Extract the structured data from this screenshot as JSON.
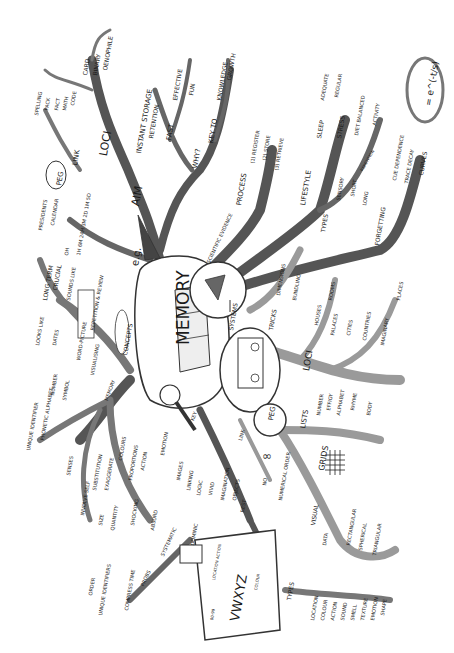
{
  "title": "MEMORY",
  "colors": {
    "branch_dark": "#555555",
    "branch_light": "#9a9a9a",
    "ink": "#1a1a1a",
    "paper": "#ffffff"
  },
  "labels": [
    {
      "id": "memory",
      "text": "MEMORY",
      "x": 175,
      "y": 345,
      "size": 17,
      "rot": -90,
      "bold": false
    },
    {
      "id": "aim",
      "text": "AIM",
      "x": 130,
      "y": 205,
      "size": 11,
      "rot": -80
    },
    {
      "id": "eg",
      "text": "e.g.",
      "x": 130,
      "y": 265,
      "size": 10,
      "rot": -80
    },
    {
      "id": "instant-storage",
      "text": "INSTANT STORAGE",
      "x": 136,
      "y": 153,
      "size": 7,
      "rot": -80
    },
    {
      "id": "retention",
      "text": "RETENTION",
      "x": 148,
      "y": 138,
      "size": 6,
      "rot": -80
    },
    {
      "id": "fast",
      "text": "FAST",
      "x": 166,
      "y": 140,
      "size": 7,
      "rot": -80
    },
    {
      "id": "effective",
      "text": "EFFECTIVE",
      "x": 172,
      "y": 100,
      "size": 6,
      "rot": -80
    },
    {
      "id": "fun",
      "text": "FUN",
      "x": 188,
      "y": 95,
      "size": 6,
      "rot": -80
    },
    {
      "id": "why",
      "text": "WHY?",
      "x": 192,
      "y": 168,
      "size": 7,
      "rot": -80
    },
    {
      "id": "key-to",
      "text": "KEY TO",
      "x": 208,
      "y": 143,
      "size": 7,
      "rot": -80
    },
    {
      "id": "knowledge",
      "text": "KNOWLEDGE",
      "x": 216,
      "y": 100,
      "size": 6,
      "rot": -80
    },
    {
      "id": "growth",
      "text": "GROWTH",
      "x": 226,
      "y": 80,
      "size": 6,
      "rot": -80
    },
    {
      "id": "loci-top",
      "text": "LOCI",
      "x": 98,
      "y": 155,
      "size": 11,
      "rot": -80
    },
    {
      "id": "link-top",
      "text": "LINK",
      "x": 72,
      "y": 165,
      "size": 7,
      "rot": -80
    },
    {
      "id": "peg-top",
      "text": "PEG",
      "x": 56,
      "y": 185,
      "size": 7,
      "rot": -80
    },
    {
      "id": "card",
      "text": "CARD",
      "x": 82,
      "y": 75,
      "size": 6,
      "rot": -80
    },
    {
      "id": "binary",
      "text": "BINARY",
      "x": 92,
      "y": 75,
      "size": 6,
      "rot": -80
    },
    {
      "id": "oenophile",
      "text": "OENOPHILE",
      "x": 102,
      "y": 70,
      "size": 6,
      "rot": -80
    },
    {
      "id": "spelling",
      "text": "SPELLING",
      "x": 34,
      "y": 115,
      "size": 5,
      "rot": -80
    },
    {
      "id": "pack",
      "text": "PACK",
      "x": 44,
      "y": 110,
      "size": 5,
      "rot": -80
    },
    {
      "id": "fact",
      "text": "FACT",
      "x": 54,
      "y": 110,
      "size": 5,
      "rot": -80
    },
    {
      "id": "math",
      "text": "MATH",
      "x": 62,
      "y": 110,
      "size": 5,
      "rot": -80
    },
    {
      "id": "code",
      "text": "CODE",
      "x": 70,
      "y": 105,
      "size": 5,
      "rot": -80
    },
    {
      "id": "presidents",
      "text": "PRESIDENTS",
      "x": 38,
      "y": 230,
      "size": 5,
      "rot": -80
    },
    {
      "id": "calendar",
      "text": "CALENDAR",
      "x": 50,
      "y": 225,
      "size": 5,
      "rot": -80
    },
    {
      "id": "oh",
      "text": "OH",
      "x": 64,
      "y": 255,
      "size": 5,
      "rot": -80
    },
    {
      "id": "times",
      "text": "1H 6M 24H 3M 2D 1M 5D",
      "x": 76,
      "y": 255,
      "size": 5,
      "rot": -80
    },
    {
      "id": "long-term",
      "text": "LONG TERM",
      "x": 42,
      "y": 300,
      "size": 6,
      "rot": -80
    },
    {
      "id": "crucial",
      "text": "CRUCIAL",
      "x": 52,
      "y": 290,
      "size": 6,
      "rot": -80
    },
    {
      "id": "sounds-like",
      "text": "SOUNDS LIKE",
      "x": 66,
      "y": 300,
      "size": 5,
      "rot": -80
    },
    {
      "id": "repetition-review",
      "text": "REPETITION & REVIEW",
      "x": 90,
      "y": 330,
      "size": 5,
      "rot": -80
    },
    {
      "id": "looks-like",
      "text": "LOOKS LIKE",
      "x": 35,
      "y": 345,
      "size": 5,
      "rot": -80
    },
    {
      "id": "dates",
      "text": "DATES",
      "x": 52,
      "y": 345,
      "size": 5,
      "rot": -80
    },
    {
      "id": "word-picture",
      "text": "WORD-PICTURE",
      "x": 76,
      "y": 360,
      "size": 5,
      "rot": -80
    },
    {
      "id": "visualising",
      "text": "VISUALISING",
      "x": 90,
      "y": 375,
      "size": 5,
      "rot": -80
    },
    {
      "id": "concepts",
      "text": "CONCEPTS",
      "x": 122,
      "y": 355,
      "size": 6,
      "rot": -80
    },
    {
      "id": "symbol",
      "text": "SYMBOL",
      "x": 62,
      "y": 400,
      "size": 5,
      "rot": -80
    },
    {
      "id": "number",
      "text": "NUMBER",
      "x": 50,
      "y": 395,
      "size": 5,
      "rot": -80
    },
    {
      "id": "unique-identifier",
      "text": "UNIQUE IDENTIFIER",
      "x": 26,
      "y": 450,
      "size": 5,
      "rot": -80
    },
    {
      "id": "phonetic-alphabet",
      "text": "PHONETIC ALPHABET",
      "x": 40,
      "y": 440,
      "size": 5,
      "rot": -80
    },
    {
      "id": "memory-peg",
      "text": "MEMORY",
      "x": 104,
      "y": 400,
      "size": 5,
      "rot": -70
    },
    {
      "id": "senses",
      "text": "SENSES",
      "x": 66,
      "y": 475,
      "size": 5,
      "rot": -80
    },
    {
      "id": "involve-self",
      "text": "INVOLVE SELF",
      "x": 80,
      "y": 515,
      "size": 5,
      "rot": -80
    },
    {
      "id": "substitution",
      "text": "SUBSTITUTION",
      "x": 92,
      "y": 490,
      "size": 5,
      "rot": -80
    },
    {
      "id": "exaggerate",
      "text": "EXAGGERATE",
      "x": 104,
      "y": 490,
      "size": 5,
      "rot": -80
    },
    {
      "id": "colours",
      "text": "COLOURS",
      "x": 118,
      "y": 460,
      "size": 5,
      "rot": -80
    },
    {
      "id": "proportions",
      "text": "PROPORTIONS",
      "x": 128,
      "y": 480,
      "size": 5,
      "rot": -80
    },
    {
      "id": "action",
      "text": "ACTION",
      "x": 140,
      "y": 470,
      "size": 5,
      "rot": -80
    },
    {
      "id": "emotion",
      "text": "EMOTION",
      "x": 160,
      "y": 455,
      "size": 5,
      "rot": -80
    },
    {
      "id": "size",
      "text": "SIZE",
      "x": 98,
      "y": 525,
      "size": 5,
      "rot": -80
    },
    {
      "id": "quantity",
      "text": "QUANTITY",
      "x": 110,
      "y": 530,
      "size": 5,
      "rot": -80
    },
    {
      "id": "shocking",
      "text": "SHOCKING",
      "x": 130,
      "y": 525,
      "size": 5,
      "rot": -80
    },
    {
      "id": "absurd",
      "text": "ABSURD",
      "x": 150,
      "y": 530,
      "size": 5,
      "rot": -80
    },
    {
      "id": "key",
      "text": "KEY",
      "x": 190,
      "y": 420,
      "size": 5,
      "rot": -70
    },
    {
      "id": "images",
      "text": "IMAGES",
      "x": 176,
      "y": 480,
      "size": 5,
      "rot": -80
    },
    {
      "id": "linking",
      "text": "LINKING",
      "x": 186,
      "y": 490,
      "size": 5,
      "rot": -80
    },
    {
      "id": "logic",
      "text": "LOGIC",
      "x": 196,
      "y": 495,
      "size": 5,
      "rot": -80
    },
    {
      "id": "vivid",
      "text": "VIVID",
      "x": 208,
      "y": 495,
      "size": 5,
      "rot": -80
    },
    {
      "id": "imagination",
      "text": "IMAGINATION",
      "x": 220,
      "y": 500,
      "size": 5,
      "rot": -80
    },
    {
      "id": "objects",
      "text": "OBJECTS",
      "x": 232,
      "y": 500,
      "size": 5,
      "rot": -80
    },
    {
      "id": "rest",
      "text": "REST",
      "x": 240,
      "y": 512,
      "size": 5,
      "rot": -80
    },
    {
      "id": "link-mid",
      "text": "LINK",
      "x": 238,
      "y": 440,
      "size": 5,
      "rot": -75
    },
    {
      "id": "systematic",
      "text": "SYSTEMATIC",
      "x": 160,
      "y": 555,
      "size": 5,
      "rot": -65
    },
    {
      "id": "probs",
      "text": "PROBS",
      "x": 140,
      "y": 585,
      "size": 5,
      "rot": -65
    },
    {
      "id": "order",
      "text": "ORDER",
      "x": 88,
      "y": 595,
      "size": 5,
      "rot": -80
    },
    {
      "id": "unique-identifiers",
      "text": "UNIQUE IDENTIFIERS",
      "x": 98,
      "y": 615,
      "size": 5,
      "rot": -80
    },
    {
      "id": "compress-time",
      "text": "COMPRESS TIME",
      "x": 124,
      "y": 610,
      "size": 5,
      "rot": -80
    },
    {
      "id": "dominic",
      "text": "DOMINIC",
      "x": 190,
      "y": 545,
      "size": 5,
      "rot": -80
    },
    {
      "id": "vwxyz",
      "text": "VWXYZ",
      "x": 228,
      "y": 620,
      "size": 13,
      "rot": -80
    },
    {
      "id": "00-99",
      "text": "00-99",
      "x": 210,
      "y": 620,
      "size": 4,
      "rot": -80
    },
    {
      "id": "location-action",
      "text": "LOCATION ACTION",
      "x": 212,
      "y": 580,
      "size": 4,
      "rot": -80
    },
    {
      "id": "colour-vw",
      "text": "COLOUR",
      "x": 254,
      "y": 590,
      "size": 4,
      "rot": -80
    },
    {
      "id": "types-bottom",
      "text": "TYPES",
      "x": 286,
      "y": 600,
      "size": 6,
      "rot": -80
    },
    {
      "id": "location",
      "text": "LOCATION",
      "x": 310,
      "y": 620,
      "size": 5,
      "rot": -80
    },
    {
      "id": "colour",
      "text": "COLOUR",
      "x": 320,
      "y": 620,
      "size": 5,
      "rot": -80
    },
    {
      "id": "action-b",
      "text": "ACTION",
      "x": 330,
      "y": 620,
      "size": 5,
      "rot": -80
    },
    {
      "id": "sound",
      "text": "SOUND",
      "x": 340,
      "y": 620,
      "size": 5,
      "rot": -80
    },
    {
      "id": "smell",
      "text": "SMELL",
      "x": 350,
      "y": 620,
      "size": 5,
      "rot": -80
    },
    {
      "id": "texture",
      "text": "TEXTURE",
      "x": 360,
      "y": 620,
      "size": 5,
      "rot": -80
    },
    {
      "id": "emotion-b",
      "text": "EMOTION",
      "x": 370,
      "y": 620,
      "size": 5,
      "rot": -80
    },
    {
      "id": "shape",
      "text": "SHAPE",
      "x": 380,
      "y": 615,
      "size": 5,
      "rot": -80
    },
    {
      "id": "no",
      "text": "NO",
      "x": 262,
      "y": 485,
      "size": 5,
      "rot": -80
    },
    {
      "id": "numerical-order",
      "text": "NUMERICAL ORDER",
      "x": 278,
      "y": 500,
      "size": 5,
      "rot": -80
    },
    {
      "id": "visual",
      "text": "VISUAL",
      "x": 310,
      "y": 525,
      "size": 6,
      "rot": -80
    },
    {
      "id": "grids",
      "text": "GRIDS",
      "x": 318,
      "y": 470,
      "size": 8,
      "rot": -80
    },
    {
      "id": "data",
      "text": "DATA",
      "x": 322,
      "y": 545,
      "size": 5,
      "rot": -80
    },
    {
      "id": "rectangular",
      "text": "RECTANGULAR",
      "x": 346,
      "y": 545,
      "size": 5,
      "rot": -80
    },
    {
      "id": "spherical",
      "text": "SPHERICAL",
      "x": 358,
      "y": 550,
      "size": 5,
      "rot": -80
    },
    {
      "id": "triangular",
      "text": "TRIANGULAR",
      "x": 372,
      "y": 555,
      "size": 5,
      "rot": -80
    },
    {
      "id": "systems",
      "text": "SYSTEMS",
      "x": 228,
      "y": 330,
      "size": 6,
      "rot": -80
    },
    {
      "id": "peg-mid",
      "text": "PEG",
      "x": 268,
      "y": 420,
      "size": 7,
      "rot": -80
    },
    {
      "id": "lists",
      "text": "LISTS",
      "x": 300,
      "y": 428,
      "size": 7,
      "rot": -80
    },
    {
      "id": "loci-mid",
      "text": "LOCI",
      "x": 302,
      "y": 370,
      "size": 9,
      "rot": -80
    },
    {
      "id": "number-l",
      "text": "NUMBER",
      "x": 316,
      "y": 415,
      "size": 5,
      "rot": -80
    },
    {
      "id": "effigy",
      "text": "EFFIGY",
      "x": 326,
      "y": 410,
      "size": 5,
      "rot": -80
    },
    {
      "id": "alphabet",
      "text": "ALPHABET",
      "x": 336,
      "y": 415,
      "size": 5,
      "rot": -80
    },
    {
      "id": "rhyme",
      "text": "RHYME",
      "x": 350,
      "y": 410,
      "size": 5,
      "rot": -80
    },
    {
      "id": "body",
      "text": "BODY",
      "x": 366,
      "y": 415,
      "size": 5,
      "rot": -80
    },
    {
      "id": "tricks",
      "text": "TRICKS",
      "x": 268,
      "y": 330,
      "size": 6,
      "rot": -80
    },
    {
      "id": "dimensions",
      "text": "DIMENSIONS",
      "x": 276,
      "y": 295,
      "size": 5,
      "rot": -80
    },
    {
      "id": "bundling",
      "text": "BUNDLING",
      "x": 292,
      "y": 300,
      "size": 5,
      "rot": -80
    },
    {
      "id": "houses",
      "text": "HOUSES",
      "x": 314,
      "y": 325,
      "size": 5,
      "rot": -80
    },
    {
      "id": "rooms",
      "text": "ROOMS",
      "x": 328,
      "y": 300,
      "size": 5,
      "rot": -80
    },
    {
      "id": "palaces",
      "text": "PALACES",
      "x": 330,
      "y": 335,
      "size": 5,
      "rot": -80
    },
    {
      "id": "cities",
      "text": "CITIES",
      "x": 346,
      "y": 335,
      "size": 5,
      "rot": -80
    },
    {
      "id": "countries",
      "text": "COUNTRIES",
      "x": 362,
      "y": 340,
      "size": 5,
      "rot": -80
    },
    {
      "id": "imaginary",
      "text": "IMAGINARY",
      "x": 380,
      "y": 345,
      "size": 5,
      "rot": -80
    },
    {
      "id": "places",
      "text": "PLACES",
      "x": 396,
      "y": 300,
      "size": 5,
      "rot": -80
    },
    {
      "id": "scientific-evidence",
      "text": "SCIENTIFIC EVIDENCE",
      "x": 206,
      "y": 262,
      "size": 5,
      "rot": -65
    },
    {
      "id": "process",
      "text": "PROCESS",
      "x": 236,
      "y": 205,
      "size": 7,
      "rot": -80
    },
    {
      "id": "register",
      "text": "(1) REGISTER",
      "x": 250,
      "y": 163,
      "size": 5,
      "rot": -80
    },
    {
      "id": "store",
      "text": "(2) STORE",
      "x": 262,
      "y": 160,
      "size": 5,
      "rot": -80
    },
    {
      "id": "retrieve",
      "text": "(3) RETRIEVE",
      "x": 274,
      "y": 170,
      "size": 5,
      "rot": -80
    },
    {
      "id": "lifestyle",
      "text": "LIFESTYLE",
      "x": 300,
      "y": 205,
      "size": 7,
      "rot": -80
    },
    {
      "id": "sleep",
      "text": "SLEEP",
      "x": 316,
      "y": 138,
      "size": 6,
      "rot": -80
    },
    {
      "id": "adequate",
      "text": "ADEQUATE",
      "x": 320,
      "y": 100,
      "size": 5,
      "rot": -80
    },
    {
      "id": "regular",
      "text": "REGULAR",
      "x": 334,
      "y": 97,
      "size": 5,
      "rot": -80
    },
    {
      "id": "stress",
      "text": "STRESS",
      "x": 336,
      "y": 138,
      "size": 6,
      "rot": -80
    },
    {
      "id": "diet-balanced",
      "text": "DIET BALANCED",
      "x": 354,
      "y": 135,
      "size": 5,
      "rot": -80
    },
    {
      "id": "activity",
      "text": "ACTIVITY",
      "x": 372,
      "y": 125,
      "size": 5,
      "rot": -80
    },
    {
      "id": "types-right",
      "text": "TYPES",
      "x": 320,
      "y": 232,
      "size": 6,
      "rot": -80
    },
    {
      "id": "sensory",
      "text": "SENSORY",
      "x": 336,
      "y": 200,
      "size": 5,
      "rot": -80
    },
    {
      "id": "short",
      "text": "SHORT",
      "x": 350,
      "y": 196,
      "size": 5,
      "rot": -80
    },
    {
      "id": "long",
      "text": "LONG",
      "x": 362,
      "y": 205,
      "size": 5,
      "rot": -80
    },
    {
      "id": "repetition-r",
      "text": "REPETITION",
      "x": 360,
      "y": 170,
      "size": 4,
      "rot": -60
    },
    {
      "id": "forgetting",
      "text": "FORGETTING",
      "x": 374,
      "y": 245,
      "size": 6,
      "rot": -80
    },
    {
      "id": "cue-dependence",
      "text": "CUE DEPENDENCE",
      "x": 392,
      "y": 180,
      "size": 5,
      "rot": -80
    },
    {
      "id": "trace-decay",
      "text": "TRACE DECAY",
      "x": 404,
      "y": 183,
      "size": 5,
      "rot": -80
    },
    {
      "id": "curves",
      "text": "CURVES",
      "x": 418,
      "y": 175,
      "size": 6,
      "rot": -80
    },
    {
      "id": "formula",
      "text": "= e^(-t/s)",
      "x": 424,
      "y": 105,
      "size": 9,
      "rot": -80
    }
  ]
}
